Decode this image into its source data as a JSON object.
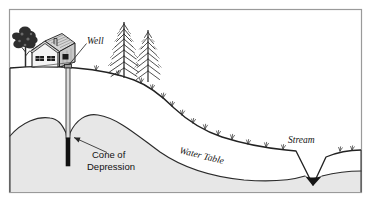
{
  "diagram": {
    "type": "cross-section-illustration",
    "frame": {
      "border_color": "#9a9a9a",
      "background_color": "#ffffff"
    },
    "labels": {
      "well": "Well",
      "cone_of_depression_line1": "Cone of",
      "cone_of_depression_line2": "Depression",
      "water_table": "Water Table",
      "stream": "Stream"
    },
    "colors": {
      "ink": "#1b1b1b",
      "saturated_zone_fill": "#e7e7e7",
      "unsaturated_zone_fill": "#ffffff",
      "well_casing_above": "#d8d8d8",
      "well_screen_below": "#101010",
      "stream_water": "#1a1a1a",
      "foliage_dark": "#2a2a2a",
      "house_wall": "#f2f2f2",
      "house_shade": "#b9b9b9",
      "leader_line": "#3a3a3a"
    },
    "features": [
      {
        "name": "house",
        "label": ""
      },
      {
        "name": "deciduous-tree",
        "label": ""
      },
      {
        "name": "conifer-tree-left",
        "label": ""
      },
      {
        "name": "conifer-tree-right",
        "label": ""
      },
      {
        "name": "well-casing",
        "label": "Well"
      },
      {
        "name": "cone-of-depression",
        "label": "Cone of Depression"
      },
      {
        "name": "water-table-line",
        "label": "Water Table"
      },
      {
        "name": "stream-notch",
        "label": "Stream"
      },
      {
        "name": "ground-surface",
        "label": ""
      },
      {
        "name": "saturated-zone",
        "label": ""
      }
    ]
  }
}
